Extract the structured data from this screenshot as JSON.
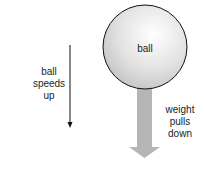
{
  "diagram": {
    "ball": {
      "label": "ball"
    },
    "motion_label": [
      "ball",
      "speeds",
      "up"
    ],
    "force_label": [
      "weight",
      "pulls",
      "down"
    ],
    "colors": {
      "ball_fill": "#e4e4e4",
      "ball_edge": "#111111",
      "force_arrow": "#b3b3b3",
      "motion_arrow": "#111111"
    }
  }
}
